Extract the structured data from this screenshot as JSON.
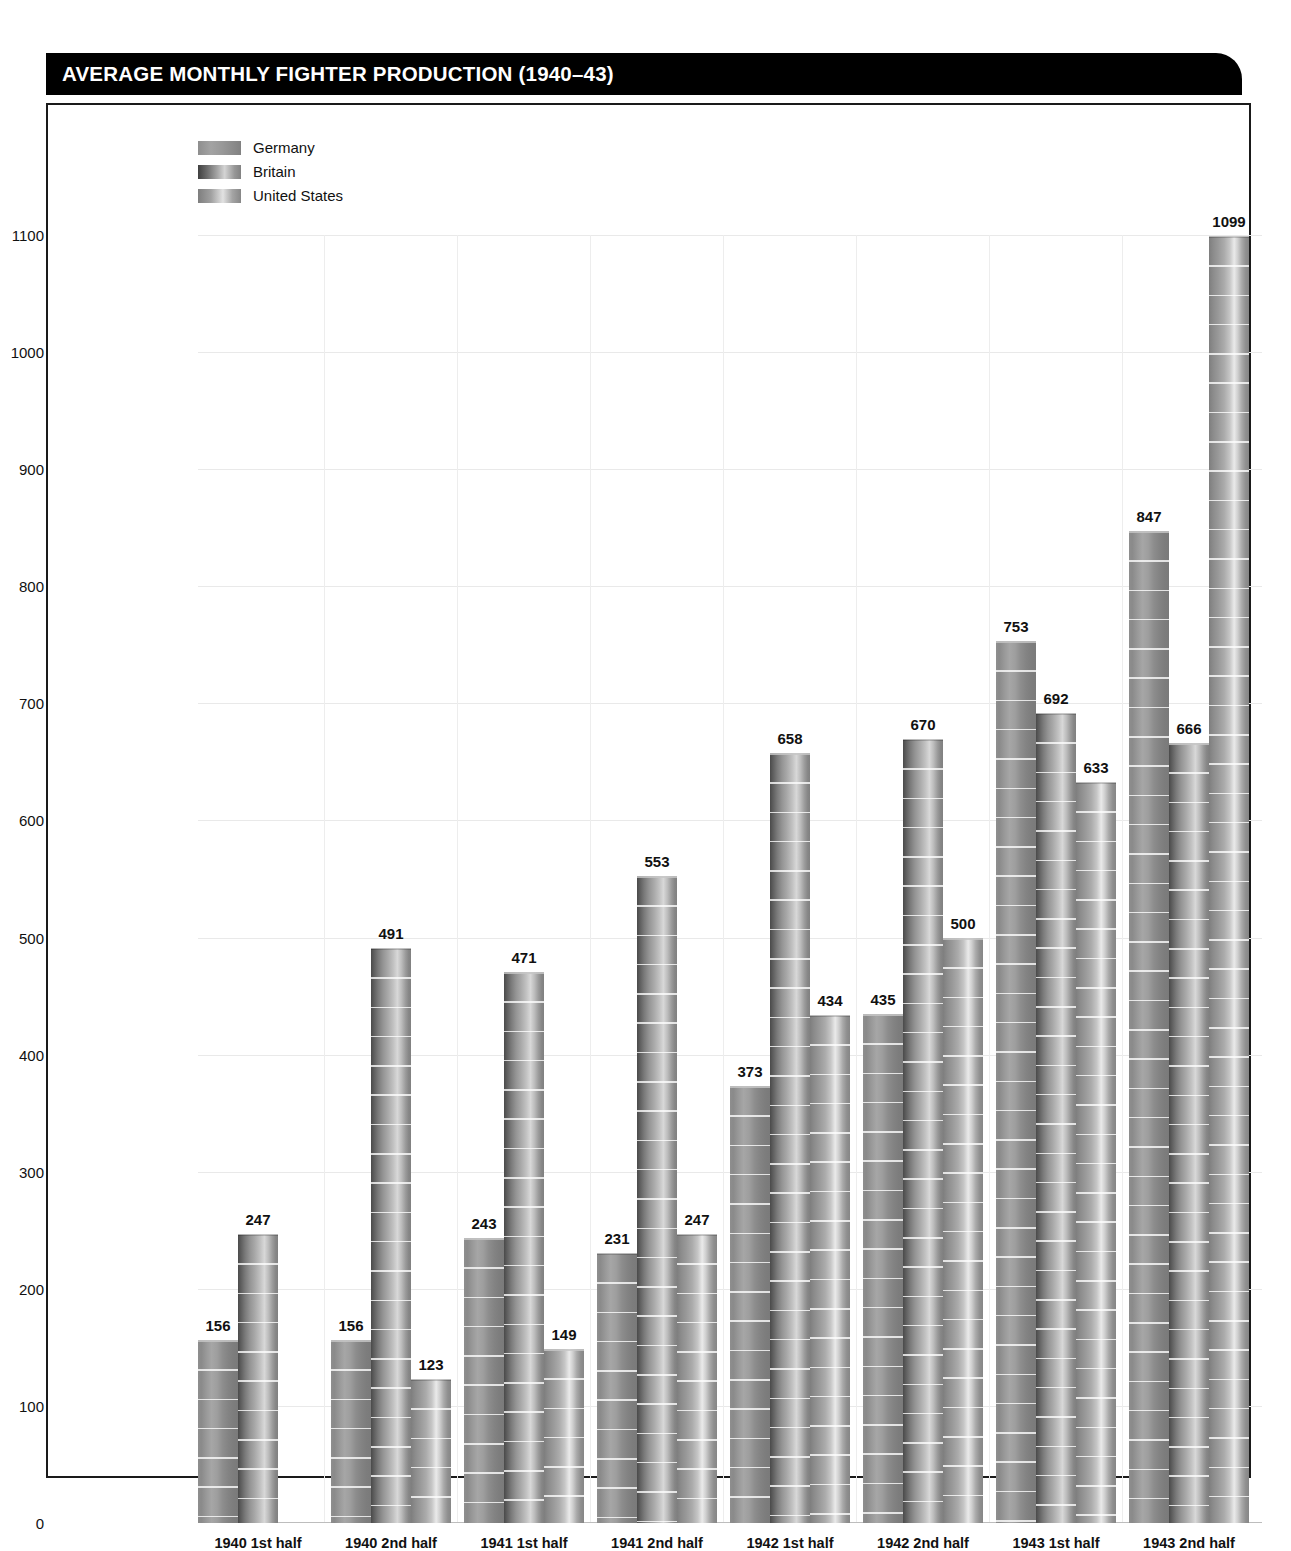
{
  "header": {
    "title": "AVERAGE MONTHLY FIGHTER PRODUCTION (1940–43)",
    "background_color": "#000000",
    "text_color": "#ffffff"
  },
  "legend": {
    "position": "top-left-inside",
    "entries": [
      {
        "label": "Germany",
        "swatch": "germany"
      },
      {
        "label": "Britain",
        "swatch": "britain"
      },
      {
        "label": "United States",
        "swatch": "united-states"
      }
    ]
  },
  "chart_data": {
    "type": "bar",
    "title": "AVERAGE MONTHLY FIGHTER PRODUCTION (1940–43)",
    "xlabel": "",
    "ylabel": "",
    "ylim": [
      0,
      1100
    ],
    "yticks": [
      0,
      100,
      200,
      300,
      400,
      500,
      600,
      700,
      800,
      900,
      1000,
      1100
    ],
    "ytick_labels": [
      "0",
      "100",
      "200",
      "300",
      "400",
      "500",
      "600",
      "700",
      "800",
      "900",
      "1000",
      "1100"
    ],
    "grid": true,
    "legend_position": "upper left",
    "categories": [
      "1940 1st half",
      "1940 2nd half",
      "1941 1st half",
      "1941 2nd half",
      "1942 1st half",
      "1942 2nd half",
      "1943 1st half",
      "1943 2nd half"
    ],
    "series": [
      {
        "name": "Germany",
        "values": [
          156,
          156,
          243,
          231,
          373,
          435,
          753,
          847
        ],
        "labels": [
          "156",
          "156",
          "243",
          "231",
          "373",
          "435",
          "753",
          "847"
        ]
      },
      {
        "name": "Britain",
        "values": [
          247,
          491,
          471,
          553,
          658,
          670,
          692,
          666
        ],
        "labels": [
          "247",
          "491",
          "471",
          "553",
          "658",
          "670",
          "692",
          "666"
        ]
      },
      {
        "name": "United States",
        "values": [
          null,
          123,
          149,
          247,
          434,
          500,
          633,
          1099
        ],
        "labels": [
          "",
          "123",
          "149",
          "247",
          "434",
          "500",
          "633",
          "1099"
        ]
      }
    ]
  }
}
